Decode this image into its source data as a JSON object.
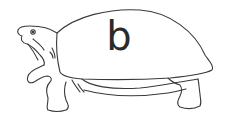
{
  "image": {
    "subject": "turtle line drawing",
    "shell_letter": "b",
    "colors": {
      "background": "#ffffff",
      "stroke": "#3a3a3a",
      "letter": "#2a2a2a"
    }
  }
}
